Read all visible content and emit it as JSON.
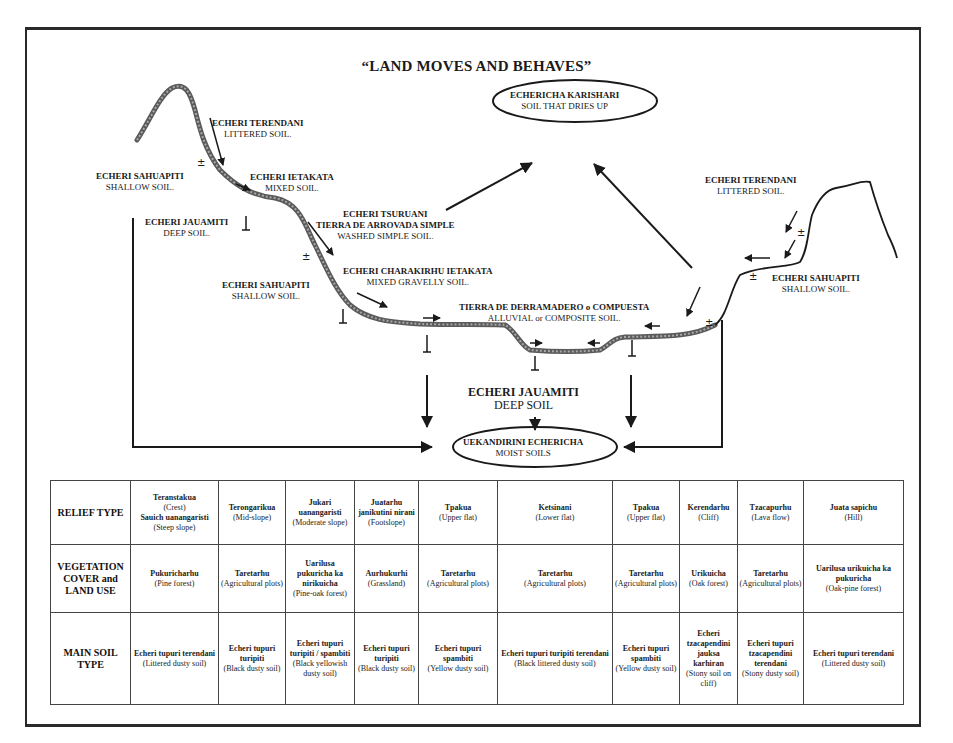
{
  "title": "“LAND MOVES AND BEHAVES”",
  "labels": {
    "left_terendani": {
      "native": "ECHERI TERENDANI",
      "english": "LITTERED SOIL."
    },
    "left_sahuapiti_top": {
      "native": "ECHERI SAHUAPITI",
      "english": "SHALLOW SOIL."
    },
    "left_ietakata": {
      "native": "ECHERI IETAKATA",
      "english": "MIXED SOIL."
    },
    "left_jauamiti": {
      "native": "ECHERI JAUAMITI",
      "english": "DEEP SOIL."
    },
    "tsuruani": {
      "native": "ECHERI TSURUANI",
      "native2": "TIERRA DE ARROVADA SIMPLE",
      "english": "WASHED SIMPLE SOIL."
    },
    "left_sahuapiti_mid": {
      "native": "ECHERI SAHUAPITI",
      "english": "SHALLOW SOIL."
    },
    "charakirhu": {
      "native": "ECHERI CHARAKIRHU  IETAKATA",
      "english": "MIXED GRAVELLY SOIL."
    },
    "derramadero": {
      "native": "TIERRA DE DERRAMADERO o COMPUESTA",
      "english": "ALLUVIAL or COMPOSITE SOIL."
    },
    "karishari": {
      "native": "ECHERICHA KARISHARI",
      "english": "SOIL THAT DRIES UP"
    },
    "right_terendani": {
      "native": "ECHERI TERENDANI",
      "english": "LITTERED SOIL."
    },
    "right_sahuapiti": {
      "native": "ECHERI SAHUAPITI",
      "english": "SHALLOW SOIL."
    },
    "center_jauamiti": {
      "native": "ECHERI JAUAMITI",
      "english": "DEEP SOIL"
    },
    "uekandirini": {
      "native": "UEKANDIRINI ECHERICHA",
      "english": "MOIST SOILS"
    }
  },
  "table": {
    "rows": [
      {
        "header": "RELIEF TYPE",
        "cells": [
          {
            "native": "Teranstakua",
            "english": "(Crest)",
            "native2": "Sauich uanangaristi",
            "english2": "(Steep slope)"
          },
          {
            "native": "Terongarikua",
            "english": "(Mid-slope)"
          },
          {
            "native": "Jukari uanangaristi",
            "english": "(Moderate slope)"
          },
          {
            "native": "Juatarhu janikutini nirani",
            "english": "(Footslope)"
          },
          {
            "native": "Tpakua",
            "english": "(Upper flat)"
          },
          {
            "native": "Ketsinani",
            "english": "(Lower flat)"
          },
          {
            "native": "Tpakua",
            "english": "(Upper flat)"
          },
          {
            "native": "Kerendarhu",
            "english": "(Cliff)"
          },
          {
            "native": "Tzacapurhu",
            "english": "(Lava flow)"
          },
          {
            "native": "Juata sapichu",
            "english": "(Hill)"
          }
        ]
      },
      {
        "header": "VEGETATION COVER and LAND USE",
        "cells": [
          {
            "native": "Pukuricharhu",
            "english": "(Pine forest)"
          },
          {
            "native": "Taretarhu",
            "english": "(Agricultural plots)"
          },
          {
            "native": "Uarilusa pukuricha ka nirikuicha",
            "english": "(Pine-oak forest)"
          },
          {
            "native": "Aurhukurhi",
            "english": "(Grassland)"
          },
          {
            "native": "Taretarhu",
            "english": "(Agricultural plots)"
          },
          {
            "native": "Taretarhu",
            "english": "(Agricultural plots)"
          },
          {
            "native": "Taretarhu",
            "english": "(Agricultural plots)"
          },
          {
            "native": "Urikuicha",
            "english": "(Oak forest)"
          },
          {
            "native": "Taretarhu",
            "english": "(Agricultural plots)"
          },
          {
            "native": "Uarilusa urikuicha ka pukuricha",
            "english": "(Oak-pine forest)"
          }
        ]
      },
      {
        "header": "MAIN SOIL TYPE",
        "cells": [
          {
            "native": "Echeri tupuri terendani",
            "english": "(Littered dusty soil)"
          },
          {
            "native": "Echeri tupuri turipiti",
            "english": "(Black dusty soil)"
          },
          {
            "native": "Echeri tupuri turipiti / spambiti",
            "english": "(Black yellowish dusty soil)"
          },
          {
            "native": "Echeri tupuri turipiti",
            "english": "(Black dusty soil)"
          },
          {
            "native": "Echeri tupuri spambiti",
            "english": "(Yellow dusty soil)"
          },
          {
            "native": "Echeri tupuri turipiti terendani",
            "english": "(Black littered dusty soil)"
          },
          {
            "native": "Echeri tupuri spambiti",
            "english": "(Yellow dusty soil)"
          },
          {
            "native": "Echeri tzacapendini jauksa karhiran",
            "english": "(Stony soil on cliff)"
          },
          {
            "native": "Echeri tupuri tzacapendini terendani",
            "english": "(Stony dusty soil)"
          },
          {
            "native": "Echeri tupuri terendani",
            "english": "(Littered dusty soil)"
          }
        ]
      }
    ]
  },
  "icons": {
    "soil_marker": "soil-profile-marker-icon",
    "arrow": "flow-arrow-icon"
  },
  "colors": {
    "ink": "#1a1a1a",
    "terrain_thick": "#6e6e6e",
    "background": "#ffffff"
  }
}
